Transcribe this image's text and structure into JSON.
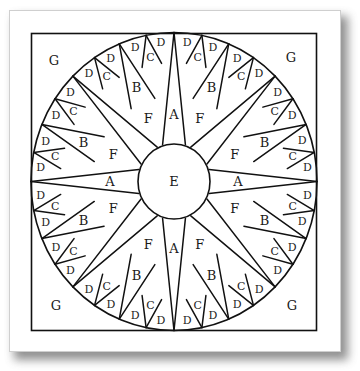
{
  "diagram": {
    "stroke_color": "#111111",
    "fill_color": "#ffffff",
    "center_label": "E",
    "corner_labels": [
      "G",
      "G",
      "G",
      "G"
    ],
    "main_point_label": "A",
    "diagonal_gap_label": "F",
    "secondary_point_label": "B",
    "tertiary_point_label": "C",
    "ring_point_label": "D",
    "piece_legend": [
      {
        "piece": "A",
        "description": "large compass points (N, E, S, W)"
      },
      {
        "piece": "B",
        "description": "secondary compass points"
      },
      {
        "piece": "C",
        "description": "tertiary compass points"
      },
      {
        "piece": "D",
        "description": "small ring points"
      },
      {
        "piece": "E",
        "description": "center circle"
      },
      {
        "piece": "F",
        "description": "diagonal background wedges"
      },
      {
        "piece": "G",
        "description": "corner background pieces"
      }
    ]
  }
}
